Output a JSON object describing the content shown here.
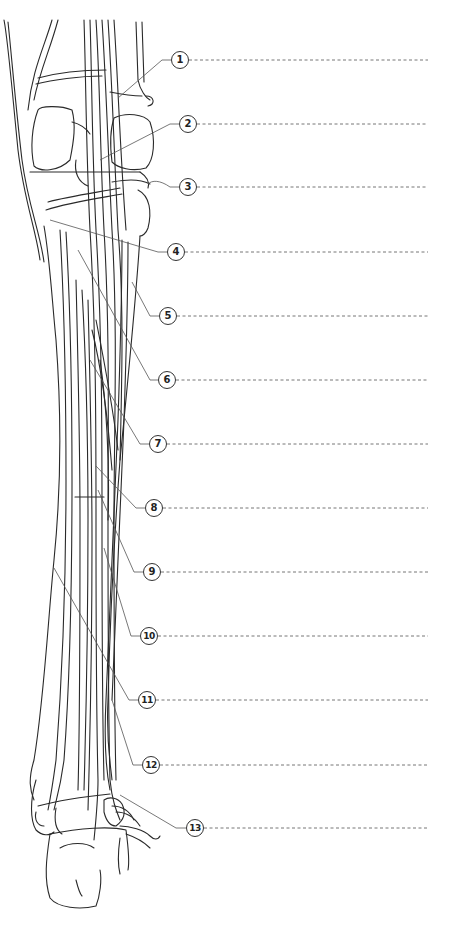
{
  "figure": {
    "line_color": "#2a2a2a",
    "leader_color": "#555555",
    "dash_color": "#666666",
    "answer_line_end_x": 428
  },
  "callouts": [
    {
      "number": "1",
      "cx": 180,
      "cy": 60,
      "tx": 118,
      "ty": 98
    },
    {
      "number": "2",
      "cx": 188,
      "cy": 124,
      "tx": 100,
      "ty": 160
    },
    {
      "number": "3",
      "cx": 188,
      "cy": 187,
      "tx": 148,
      "ty": 184
    },
    {
      "number": "4",
      "cx": 176,
      "cy": 252,
      "tx": 50,
      "ty": 220
    },
    {
      "number": "5",
      "cx": 168,
      "cy": 316,
      "tx": 132,
      "ty": 282
    },
    {
      "number": "6",
      "cx": 167,
      "cy": 380,
      "tx": 78,
      "ty": 250
    },
    {
      "number": "7",
      "cx": 158,
      "cy": 444,
      "tx": 90,
      "ty": 360
    },
    {
      "number": "8",
      "cx": 154,
      "cy": 508,
      "tx": 96,
      "ty": 466
    },
    {
      "number": "9",
      "cx": 152,
      "cy": 572,
      "tx": 98,
      "ty": 490
    },
    {
      "number": "10",
      "cx": 149,
      "cy": 636,
      "tx": 104,
      "ty": 548
    },
    {
      "number": "11",
      "cx": 147,
      "cy": 700,
      "tx": 54,
      "ty": 568
    },
    {
      "number": "12",
      "cx": 151,
      "cy": 765,
      "tx": 112,
      "ty": 700
    },
    {
      "number": "13",
      "cx": 195,
      "cy": 828,
      "tx": 120,
      "ty": 795
    }
  ]
}
